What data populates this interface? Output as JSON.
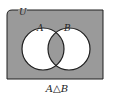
{
  "diagram": {
    "type": "venn",
    "universe_label": "U",
    "sets": [
      {
        "label": "A"
      },
      {
        "label": "B"
      }
    ],
    "caption": "A△B",
    "colors": {
      "shade": "#9a9a9a",
      "unshaded": "#ffffff",
      "stroke": "#1e1e1e"
    },
    "shaded_regions": [
      "outside",
      "A∩B"
    ],
    "unshaded_regions": [
      "A only",
      "B only"
    ]
  }
}
